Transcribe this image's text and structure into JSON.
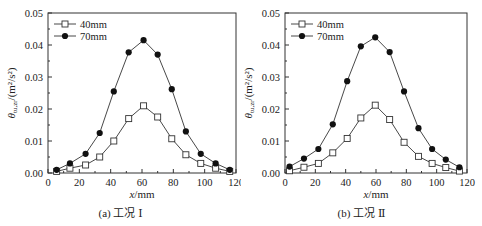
{
  "chart_data": [
    {
      "type": "line",
      "caption": "(a) 工况 Ⅰ",
      "xlabel": "x/mm",
      "ylabel": "θtu,zr/(m²/s²)",
      "xlim": [
        0,
        120
      ],
      "ylim": [
        0,
        0.05
      ],
      "xticks": [
        0,
        20,
        40,
        60,
        80,
        100,
        120
      ],
      "yticks": [
        "0.00",
        "0.01",
        "0.02",
        "0.03",
        "0.04",
        "0.05"
      ],
      "legend_position": "upper left",
      "grid": false,
      "series": [
        {
          "name": "40mm",
          "marker": "open-square",
          "x": [
            5.5,
            14,
            24,
            33,
            42,
            51.5,
            61,
            70,
            79,
            88,
            97.5,
            107,
            116
          ],
          "values": [
            0.0005,
            0.0015,
            0.0025,
            0.005,
            0.01,
            0.017,
            0.021,
            0.0175,
            0.0107,
            0.0057,
            0.003,
            0.0015,
            0.0005
          ]
        },
        {
          "name": "70mm",
          "marker": "filled-circle",
          "x": [
            5.5,
            14,
            24,
            33,
            42,
            51.5,
            61,
            70,
            79,
            88,
            97.5,
            107,
            116
          ],
          "values": [
            0.001,
            0.003,
            0.006,
            0.0125,
            0.0255,
            0.0377,
            0.0415,
            0.037,
            0.0262,
            0.013,
            0.006,
            0.003,
            0.001
          ]
        }
      ]
    },
    {
      "type": "line",
      "caption": "(b) 工况 Ⅱ",
      "xlabel": "x/mm",
      "ylabel": "θtu,zr/(m²/s²)",
      "xlim": [
        0,
        120
      ],
      "ylim": [
        0,
        0.05
      ],
      "xticks": [
        0,
        20,
        40,
        60,
        80,
        100,
        120
      ],
      "yticks": [
        "0.00",
        "0.01",
        "0.02",
        "0.03",
        "0.04",
        "0.05"
      ],
      "legend_position": "upper left",
      "grid": false,
      "series": [
        {
          "name": "40mm",
          "marker": "open-square",
          "x": [
            3,
            12.5,
            22,
            31.5,
            41,
            50,
            59.5,
            69,
            78.5,
            88,
            97,
            106,
            115
          ],
          "values": [
            0.0007,
            0.0018,
            0.003,
            0.0063,
            0.0108,
            0.0172,
            0.0212,
            0.0167,
            0.0096,
            0.0052,
            0.003,
            0.0017,
            0.0006
          ]
        },
        {
          "name": "70mm",
          "marker": "filled-circle",
          "x": [
            3,
            12.5,
            22,
            31.5,
            41,
            50,
            59.5,
            69,
            78.5,
            88,
            97,
            106,
            115
          ],
          "values": [
            0.002,
            0.0045,
            0.0075,
            0.0152,
            0.0287,
            0.0396,
            0.0424,
            0.0378,
            0.0255,
            0.014,
            0.0075,
            0.0042,
            0.0018
          ]
        }
      ]
    }
  ],
  "layout": {
    "panels": [
      {
        "plot_left": 48,
        "plot_right": 236,
        "plot_top": 13,
        "plot_bottom": 173
      },
      {
        "plot_left": 44,
        "plot_right": 226,
        "plot_top": 13,
        "plot_bottom": 173
      }
    ],
    "colors": {
      "line": "#333333",
      "marker_fill": "#111111",
      "axis": "#333333"
    }
  }
}
